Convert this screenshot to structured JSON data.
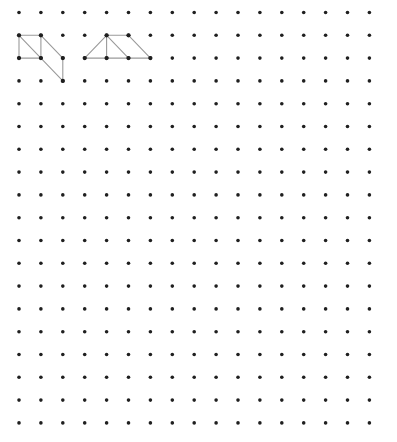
{
  "grid": {
    "columns": 17,
    "rows": 19,
    "origin_x": 19,
    "origin_y": 12.5,
    "spacing_x": 21.9,
    "spacing_y": 22.8,
    "dot_radius": 1.8,
    "dot_color": "#1f1f1f"
  },
  "line_color": "#9a9a9a",
  "figures": [
    {
      "name": "left-figure",
      "vertices": [
        [
          0,
          1
        ],
        [
          1,
          1
        ],
        [
          0,
          2
        ],
        [
          1,
          2
        ],
        [
          2,
          2
        ],
        [
          2,
          3
        ]
      ],
      "edges": [
        [
          [
            0,
            1
          ],
          [
            1,
            1
          ]
        ],
        [
          [
            0,
            1
          ],
          [
            0,
            2
          ]
        ],
        [
          [
            1,
            1
          ],
          [
            1,
            2
          ]
        ],
        [
          [
            0,
            2
          ],
          [
            1,
            2
          ]
        ],
        [
          [
            0,
            1
          ],
          [
            1,
            2
          ]
        ],
        [
          [
            1,
            1
          ],
          [
            2,
            2
          ]
        ],
        [
          [
            1,
            2
          ],
          [
            2,
            3
          ]
        ],
        [
          [
            2,
            2
          ],
          [
            2,
            3
          ]
        ]
      ]
    },
    {
      "name": "right-figure",
      "vertices": [
        [
          4,
          1
        ],
        [
          5,
          1
        ],
        [
          3,
          2
        ],
        [
          4,
          2
        ],
        [
          5,
          2
        ],
        [
          6,
          2
        ]
      ],
      "edges": [
        [
          [
            3,
            2
          ],
          [
            4,
            1
          ]
        ],
        [
          [
            4,
            1
          ],
          [
            5,
            1
          ]
        ],
        [
          [
            4,
            1
          ],
          [
            4,
            2
          ]
        ],
        [
          [
            4,
            1
          ],
          [
            5,
            2
          ]
        ],
        [
          [
            5,
            1
          ],
          [
            6,
            2
          ]
        ],
        [
          [
            3,
            2
          ],
          [
            6,
            2
          ]
        ]
      ]
    }
  ]
}
